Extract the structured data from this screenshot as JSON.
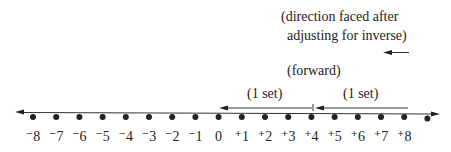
{
  "annotations": {
    "direction_line1": "(direction faced after",
    "direction_line2": "adjusting for inverse)",
    "forward": "(forward)",
    "set_left": "(1 set)",
    "set_right": "(1 set)"
  },
  "number_line": {
    "labels": [
      "⁻8",
      "⁻7",
      "⁻6",
      "⁻5",
      "⁻4",
      "⁻3",
      "⁻2",
      "⁻1",
      "0",
      "⁺1",
      "⁺2",
      "⁺3",
      "⁺4",
      "⁺5",
      "⁺6",
      "⁺7",
      "⁺8"
    ],
    "start_value": -8,
    "end_value": 8,
    "extra_point_after_end": true
  },
  "arrows": [
    {
      "name": "set-arrow-1",
      "from": 4,
      "to": 0
    },
    {
      "name": "set-arrow-2",
      "from": 8,
      "to": 4
    },
    {
      "name": "direction-arrow",
      "direction": "left"
    }
  ],
  "colors": {
    "ink": "#222222",
    "background": "#ffffff"
  }
}
